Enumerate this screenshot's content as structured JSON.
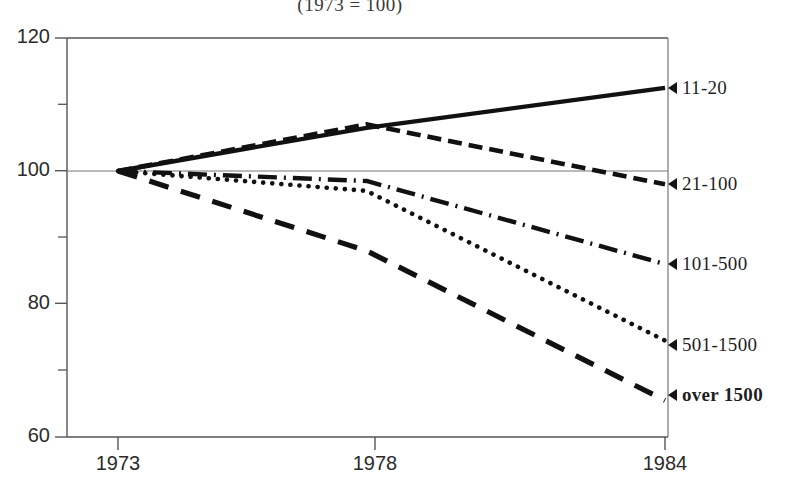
{
  "chart_data": {
    "type": "line",
    "title": "(1973 = 100)",
    "xlabel": "",
    "ylabel": "",
    "x": [
      1973,
      1978,
      1984
    ],
    "xtick_labels": [
      "1973",
      "1978",
      "1984"
    ],
    "ytick_labels": [
      "120",
      "100",
      "80",
      "60"
    ],
    "yticks": [
      120,
      100,
      80,
      60
    ],
    "yticks_minor": [
      110,
      90,
      70
    ],
    "xlim": [
      1973,
      1984
    ],
    "ylim": [
      60,
      120
    ],
    "grid": false,
    "reference_line": 100,
    "legend_position": "right",
    "series": [
      {
        "name": "11-20",
        "label": "11-20",
        "style": "solid",
        "values": [
          100,
          106.5,
          112.5
        ]
      },
      {
        "name": "21-100",
        "label": "21-100",
        "style": "short-dash",
        "values": [
          100,
          107,
          98
        ]
      },
      {
        "name": "101-500",
        "label": "101-500",
        "style": "dash-dot",
        "values": [
          100,
          98.5,
          86
        ]
      },
      {
        "name": "501-1500",
        "label": "501-1500",
        "style": "dotted",
        "values": [
          100,
          97,
          74.5
        ]
      },
      {
        "name": "over 1500",
        "label": "over  1500",
        "style": "long-dash",
        "values": [
          100,
          88,
          65.5
        ]
      }
    ],
    "colors": {
      "line": "#111111",
      "axis": "#555555",
      "text": "#1f1f1f",
      "background": "#ffffff"
    }
  },
  "axis": {
    "y_labels": {
      "t120": "120",
      "t100": "100",
      "t80": "80",
      "t60": "60"
    },
    "x_labels": {
      "x1973": "1973",
      "x1978": "1978",
      "x1984": "1984"
    }
  },
  "legend": {
    "items": [
      {
        "label": "11-20"
      },
      {
        "label": "21-100"
      },
      {
        "label": "101-500"
      },
      {
        "label": "501-1500"
      },
      {
        "label": "over  1500"
      }
    ]
  }
}
